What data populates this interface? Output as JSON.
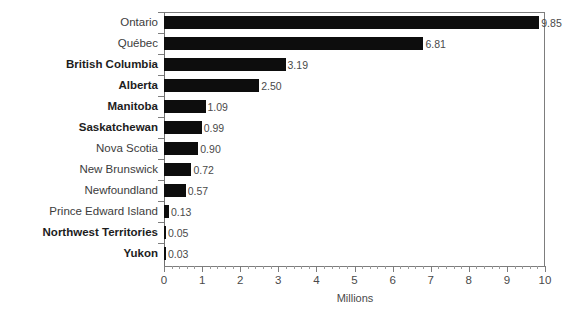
{
  "chart_data": {
    "type": "bar",
    "orientation": "horizontal",
    "title": "",
    "xlabel": "Millions",
    "ylabel": "",
    "xlim": [
      0,
      10
    ],
    "xticks": [
      0,
      1,
      2,
      3,
      4,
      5,
      6,
      7,
      8,
      9,
      10
    ],
    "xtick_labels": [
      "0",
      "1",
      "2",
      "3",
      "4",
      "5",
      "6",
      "7",
      "8",
      "9",
      "10"
    ],
    "minor_ticks_per_interval": 5,
    "grid": false,
    "legend": null,
    "bar_color": "#0d0d0d",
    "axis_color": "#7d7d7d",
    "label_color": "#3c3c3c",
    "categories": [
      "Ontario",
      "Québec",
      "British Columbia",
      "Alberta",
      "Manitoba",
      "Saskatchewan",
      "Nova Scotia",
      "New Brunswick",
      "Newfoundland",
      "Prince Edward Island",
      "Northwest Territories",
      "Yukon"
    ],
    "values": [
      9.85,
      6.81,
      3.19,
      2.5,
      1.09,
      0.99,
      0.9,
      0.72,
      0.57,
      0.13,
      0.05,
      0.03
    ],
    "value_labels": [
      "9.85",
      "6.81",
      "3.19",
      "2.50",
      "1.09",
      "0.99",
      "0.90",
      "0.72",
      "0.57",
      "0.13",
      "0.05",
      "0.03"
    ],
    "bold_categories": [
      "British Columbia",
      "Alberta",
      "Manitoba",
      "Saskatchewan",
      "Northwest Territories",
      "Yukon"
    ]
  }
}
